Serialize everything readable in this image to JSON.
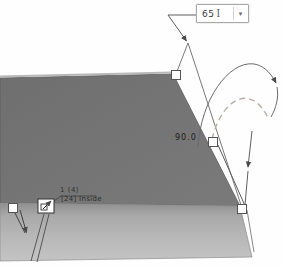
{
  "viewport": {
    "description": "CAD sheet-metal flange edit view with drag handles and rotate manipulator"
  },
  "dim_box": {
    "value": "65",
    "cursor_icon": "I",
    "dropdown_icon": "▾"
  },
  "angle_label": "90.0",
  "note": {
    "line1": "1 (4)",
    "line2": "[24] Inside"
  },
  "colors": {
    "top_face": "#747474",
    "front_face_top": "#8f8f8f",
    "front_face_bottom": "#c4c4c4",
    "edge_line": "#555555",
    "dim_line": "#6a6a6a",
    "dashed_arc": "#b8b0a4",
    "handle_fill": "#ffffff",
    "handle_border": "#555555",
    "background": "#fefefe"
  },
  "handles": {
    "count": 4
  }
}
